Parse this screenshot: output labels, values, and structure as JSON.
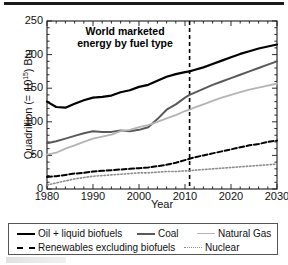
{
  "figure": {
    "top_rule": "",
    "bottom_partial_caption": ""
  },
  "chart_data": {
    "type": "line",
    "title": "World marketed energy by fuel type",
    "title_line1": "World marketed",
    "title_line2": "energy by fuel type",
    "xlabel": "Year",
    "ylabel": "Quadrillion (= 10",
    "ylabel_sup": "15",
    "ylabel_tail": ") Btu",
    "ylabel_full": "Quadrillion (= 10^15) Btu",
    "xlim": [
      1980,
      2030
    ],
    "ylim": [
      0,
      250
    ],
    "xticks": [
      1980,
      1990,
      2000,
      2010,
      2020,
      2030
    ],
    "xtick_labels": [
      "1980",
      "1990",
      "2000",
      "2010",
      "2020",
      "2030"
    ],
    "yticks": [
      0,
      50,
      100,
      150,
      200,
      250
    ],
    "ytick_labels": [
      "0",
      "50",
      "100",
      "150",
      "200",
      "250"
    ],
    "x_minor_step": 2,
    "y_minor_step": 10,
    "grid": false,
    "legend_position": "below-plot",
    "annotations": [
      {
        "name": "projection-divider",
        "type": "vline",
        "x": 2011,
        "style": "dashed",
        "color": "#000000"
      }
    ],
    "x": [
      1980,
      1982,
      1984,
      1986,
      1988,
      1990,
      1992,
      1994,
      1996,
      1998,
      2000,
      2002,
      2004,
      2006,
      2008,
      2010,
      2011,
      2012,
      2014,
      2016,
      2018,
      2020,
      2022,
      2024,
      2026,
      2028,
      2030
    ],
    "series": [
      {
        "name": "Oil + liquid biofuels",
        "color": "#000000",
        "style": "solid",
        "width": 2.2,
        "values": [
          130,
          122,
          121,
          127,
          132,
          136,
          137,
          139,
          144,
          147,
          152,
          155,
          161,
          167,
          171,
          174,
          175,
          177,
          181,
          186,
          191,
          196,
          201,
          205,
          209,
          212,
          215
        ]
      },
      {
        "name": "Coal",
        "color": "#595959",
        "style": "solid",
        "width": 2.0,
        "values": [
          68,
          71,
          75,
          79,
          83,
          86,
          85,
          85,
          87,
          86,
          88,
          92,
          104,
          118,
          126,
          136,
          140,
          143,
          149,
          155,
          160,
          165,
          170,
          175,
          180,
          185,
          190
        ]
      },
      {
        "name": "Natural Gas",
        "color": "#b4b4b4",
        "style": "solid",
        "width": 1.8,
        "values": [
          51,
          54,
          60,
          65,
          70,
          75,
          78,
          81,
          86,
          88,
          92,
          95,
          100,
          105,
          110,
          116,
          118,
          121,
          126,
          131,
          136,
          140,
          144,
          148,
          151,
          154,
          157
        ]
      },
      {
        "name": "Renewables excluding biofuels",
        "color": "#000000",
        "style": "dashed",
        "width": 2.0,
        "values": [
          18,
          19,
          21,
          23,
          24,
          26,
          27,
          28,
          29,
          30,
          31,
          32,
          34,
          36,
          39,
          43,
          45,
          47,
          50,
          53,
          56,
          59,
          62,
          65,
          67,
          70,
          72
        ]
      },
      {
        "name": "Nuclear",
        "color": "#8c8c8c",
        "style": "dotted",
        "width": 1.6,
        "values": [
          6,
          9,
          12,
          15,
          17,
          19,
          20,
          21,
          22,
          23,
          24,
          24,
          25,
          26,
          26,
          27,
          27,
          28,
          29,
          30,
          31,
          32,
          33,
          34,
          35,
          36,
          37
        ]
      }
    ]
  },
  "legend": {
    "items": [
      {
        "label": "Oil + liquid biofuels",
        "style_class": "sw-solid-black"
      },
      {
        "label": "Coal",
        "style_class": "sw-solid-dark"
      },
      {
        "label": "Natural Gas",
        "style_class": "sw-solid-light"
      },
      {
        "label": "Renewables excluding biofuels",
        "style_class": "sw-dashed"
      },
      {
        "label": "Nuclear",
        "style_class": "sw-dotted"
      }
    ]
  }
}
